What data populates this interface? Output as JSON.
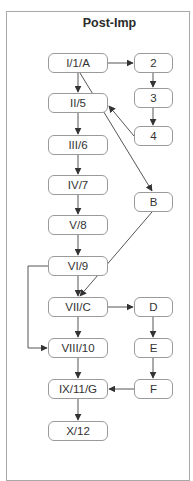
{
  "diagram": {
    "title": "Post-Imp",
    "nodes": [
      {
        "id": "n1",
        "label": "I/1/A",
        "x": 48,
        "y": 53,
        "w": 60,
        "h": 20
      },
      {
        "id": "n2",
        "label": "II/5",
        "x": 48,
        "y": 93,
        "w": 60,
        "h": 20
      },
      {
        "id": "n3",
        "label": "III/6",
        "x": 48,
        "y": 135,
        "w": 60,
        "h": 20
      },
      {
        "id": "n4",
        "label": "IV/7",
        "x": 48,
        "y": 175,
        "w": 60,
        "h": 20
      },
      {
        "id": "n5",
        "label": "V/8",
        "x": 48,
        "y": 215,
        "w": 60,
        "h": 20
      },
      {
        "id": "n6",
        "label": "VI/9",
        "x": 48,
        "y": 256,
        "w": 60,
        "h": 20
      },
      {
        "id": "n7",
        "label": "VII/C",
        "x": 48,
        "y": 297,
        "w": 60,
        "h": 20
      },
      {
        "id": "n8",
        "label": "VIII/10",
        "x": 48,
        "y": 338,
        "w": 60,
        "h": 20
      },
      {
        "id": "n9",
        "label": "IX/11/G",
        "x": 48,
        "y": 379,
        "w": 60,
        "h": 20
      },
      {
        "id": "n10",
        "label": "X/12",
        "x": 48,
        "y": 421,
        "w": 60,
        "h": 20
      },
      {
        "id": "r2",
        "label": "2",
        "x": 134,
        "y": 53,
        "w": 39,
        "h": 20
      },
      {
        "id": "r3",
        "label": "3",
        "x": 134,
        "y": 88,
        "w": 39,
        "h": 20
      },
      {
        "id": "r4",
        "label": "4",
        "x": 134,
        "y": 126,
        "w": 39,
        "h": 20
      },
      {
        "id": "rB",
        "label": "B",
        "x": 134,
        "y": 192,
        "w": 39,
        "h": 20
      },
      {
        "id": "rD",
        "label": "D",
        "x": 134,
        "y": 297,
        "w": 39,
        "h": 20
      },
      {
        "id": "rE",
        "label": "E",
        "x": 134,
        "y": 338,
        "w": 39,
        "h": 20
      },
      {
        "id": "rF",
        "label": "F",
        "x": 134,
        "y": 379,
        "w": 39,
        "h": 20
      }
    ],
    "edges": [
      {
        "from": "I/1/A",
        "to": "2"
      },
      {
        "from": "2",
        "to": "3"
      },
      {
        "from": "3",
        "to": "4"
      },
      {
        "from": "4",
        "to": "II/5"
      },
      {
        "from": "I/1/A",
        "to": "II/5"
      },
      {
        "from": "II/5",
        "to": "III/6"
      },
      {
        "from": "III/6",
        "to": "IV/7"
      },
      {
        "from": "IV/7",
        "to": "V/8"
      },
      {
        "from": "V/8",
        "to": "VI/9"
      },
      {
        "from": "VI/9",
        "to": "VII/C"
      },
      {
        "from": "I/1/A",
        "to": "B"
      },
      {
        "from": "B",
        "to": "VII/C"
      },
      {
        "from": "VI/9",
        "to": "VIII/10"
      },
      {
        "from": "VII/C",
        "to": "D"
      },
      {
        "from": "VII/C",
        "to": "VIII/10"
      },
      {
        "from": "D",
        "to": "E"
      },
      {
        "from": "E",
        "to": "F"
      },
      {
        "from": "F",
        "to": "IX/11/G"
      },
      {
        "from": "VIII/10",
        "to": "IX/11/G"
      },
      {
        "from": "IX/11/G",
        "to": "X/12"
      }
    ],
    "colors": {
      "line": "#555555",
      "border": "#9a9a9a",
      "frame": "#a8a8a8",
      "text": "#333333"
    }
  }
}
